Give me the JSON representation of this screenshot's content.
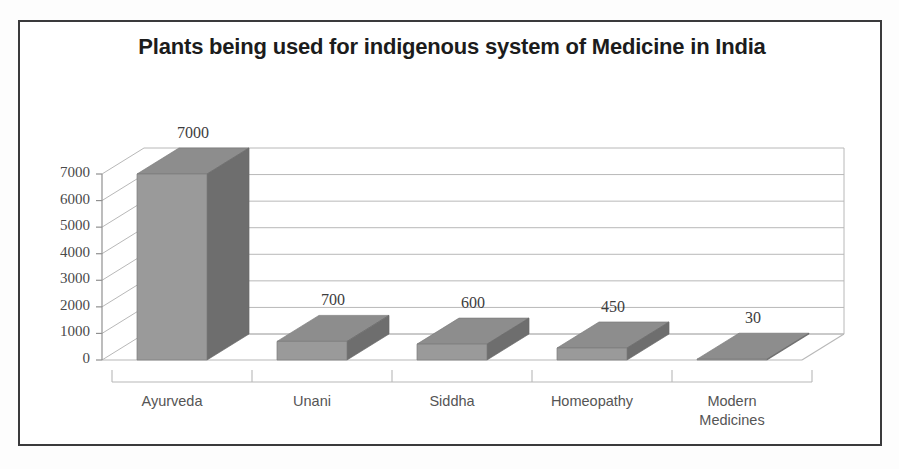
{
  "figure": {
    "border_color": "#3a3a3c",
    "background": "#ffffff"
  },
  "chart_data": {
    "type": "bar",
    "title": "Plants being used for indigenous system of Medicine in India",
    "subtitle": "",
    "xlabel": "",
    "ylabel": "",
    "categories": [
      "Ayurveda",
      "Unani",
      "Siddha",
      "Homeopathy",
      "Modern\nMedicines"
    ],
    "values": [
      7000,
      700,
      600,
      450,
      30
    ],
    "data_labels": [
      "7000",
      "700",
      "600",
      "450",
      "30"
    ],
    "ylim": [
      0,
      7000
    ],
    "yticks": [
      0,
      1000,
      2000,
      3000,
      4000,
      5000,
      6000,
      7000
    ],
    "ytick_labels": [
      "0",
      "1000",
      "2000",
      "3000",
      "4000",
      "5000",
      "6000",
      "7000"
    ],
    "grid": true,
    "grid_axis": "y",
    "legend": false,
    "legend_position": "none",
    "three_d": true,
    "series": [
      {
        "name": "Number of plants",
        "values": [
          7000,
          700,
          600,
          450,
          30
        ]
      }
    ],
    "colors": {
      "bar_front": "#9a9a9a",
      "bar_side": "#6e6e6e",
      "bar_top": "#8d8d8d",
      "gridline": "#b8b8b8",
      "axis": "#909090",
      "text": "#3d3d3d"
    }
  }
}
